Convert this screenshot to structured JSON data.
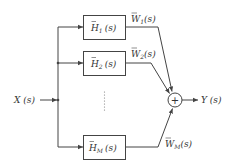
{
  "diagram": {
    "type": "block-diagram",
    "input": {
      "label": "X (s)"
    },
    "output": {
      "label": "Y (s)"
    },
    "filters": [
      {
        "name": "H",
        "subscript": "1",
        "arg": "(s)",
        "output_name": "W",
        "output_subscript": "1",
        "output_arg": "(s)"
      },
      {
        "name": "H",
        "subscript": "2",
        "arg": "(s)",
        "output_name": "W",
        "output_subscript": "2",
        "output_arg": "(s)"
      },
      {
        "name": "H",
        "subscript": "M",
        "arg": "(s)",
        "output_name": "W",
        "output_subscript": "M",
        "output_arg": "(s)"
      }
    ],
    "ellipsis": "vertical-dots",
    "summer": {
      "symbol": "+"
    },
    "colors": {
      "line": "#444444",
      "text": "#333333",
      "background": "#ffffff"
    }
  }
}
